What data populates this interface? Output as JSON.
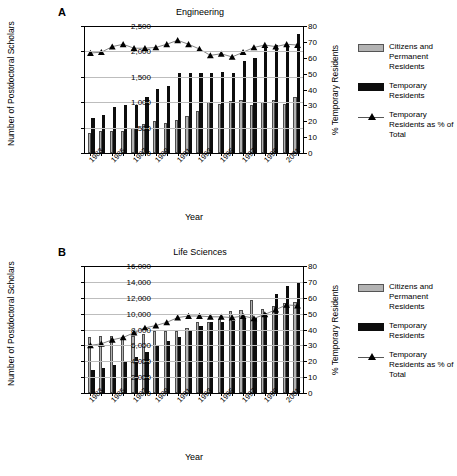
{
  "figure": {
    "panels": [
      {
        "letter": "A",
        "title": "Engineering",
        "xlabel": "Year",
        "ylabel_left": "Number of Postdoctoral Scholars",
        "ylabel_right": "% Temporary Residents"
      },
      {
        "letter": "B",
        "title": "Life Sciences",
        "xlabel": "Year",
        "ylabel_left": "Number of Postdoctoral Scholars",
        "ylabel_right": "% Temporary Residents"
      }
    ],
    "legend": {
      "items": [
        {
          "name": "citizens-swatch",
          "label": "Citizens and Permanent Residents",
          "color": "#b3b3b3"
        },
        {
          "name": "temporary-swatch",
          "label": "Temporary Residents",
          "color": "#0d0d0d"
        },
        {
          "name": "percent-line-marker",
          "label": "Temporary Residents as % of Total",
          "color": "#000000"
        }
      ]
    }
  },
  "chart_data": [
    {
      "type": "bar",
      "title": "Engineering",
      "panel": "A",
      "xlabel": "Year",
      "ylabel": "Number of Postdoctoral Scholars",
      "ylabel_secondary": "% Temporary Residents",
      "ylim": [
        0,
        2500
      ],
      "yticks": [
        "0",
        "500",
        "1,000",
        "1,500",
        "2,000",
        "2,500"
      ],
      "ylim_secondary": [
        0,
        80
      ],
      "yticks_secondary": [
        "0",
        "10",
        "20",
        "30",
        "40",
        "50",
        "60",
        "70",
        "80"
      ],
      "grid": true,
      "legend_position": "right",
      "categories": [
        1983,
        1984,
        1985,
        1986,
        1987,
        1988,
        1989,
        1990,
        1991,
        1992,
        1993,
        1994,
        1995,
        1996,
        1997,
        1998,
        1999,
        2000,
        2001,
        2002
      ],
      "xtick_labels": [
        "1983",
        "1985",
        "1987",
        "1989",
        "1991",
        "1993",
        "1995",
        "1997",
        "1999",
        "2001"
      ],
      "series": [
        {
          "name": "Citizens and Permanent Residents",
          "axis": "left",
          "color": "#b3b3b3",
          "values": [
            400,
            440,
            440,
            440,
            490,
            570,
            640,
            600,
            645,
            730,
            830,
            995,
            965,
            1015,
            1050,
            950,
            1000,
            1040,
            965,
            1095
          ]
        },
        {
          "name": "Temporary Residents",
          "axis": "left",
          "color": "#0d0d0d",
          "values": [
            680,
            755,
            905,
            945,
            945,
            1100,
            1255,
            1310,
            1570,
            1570,
            1570,
            1570,
            1600,
            1575,
            1805,
            1870,
            2105,
            2120,
            2110,
            2345
          ]
        },
        {
          "name": "Temporary Residents as % of Total",
          "axis": "right",
          "color": "#000000",
          "type": "line",
          "values": [
            63,
            63.5,
            67,
            68.5,
            66,
            66,
            66.5,
            68.5,
            71,
            68.5,
            65.5,
            61.5,
            62.5,
            60.5,
            63.5,
            66.5,
            68,
            67,
            68.5,
            68
          ]
        }
      ]
    },
    {
      "type": "bar",
      "title": "Life Sciences",
      "panel": "B",
      "xlabel": "Year",
      "ylabel": "Number of Postdoctoral Scholars",
      "ylabel_secondary": "% Temporary Residents",
      "ylim": [
        0,
        16000
      ],
      "yticks": [
        "0",
        "2,000",
        "4,000",
        "6,000",
        "8,000",
        "10,000",
        "12,000",
        "14,000",
        "16,000"
      ],
      "ylim_secondary": [
        0,
        80
      ],
      "yticks_secondary": [
        "0",
        "10",
        "20",
        "30",
        "40",
        "50",
        "60",
        "70",
        "80"
      ],
      "grid": true,
      "legend_position": "right",
      "categories": [
        1983,
        1984,
        1985,
        1986,
        1987,
        1988,
        1989,
        1990,
        1991,
        1992,
        1993,
        1994,
        1995,
        1996,
        1997,
        1998,
        1999,
        2000,
        2001,
        2002
      ],
      "xtick_labels": [
        "1983",
        "1985",
        "1987",
        "1989",
        "1991",
        "1993",
        "1995",
        "1997",
        "1999",
        "2001"
      ],
      "series": [
        {
          "name": "Citizens and Permanent Residents",
          "axis": "left",
          "color": "#b3b3b3",
          "values": [
            7100,
            7200,
            7150,
            7050,
            7200,
            7400,
            7800,
            7800,
            7800,
            8250,
            8950,
            8900,
            9350,
            10300,
            10500,
            11700,
            10600,
            11000,
            11400,
            11500
          ]
        },
        {
          "name": "Temporary Residents",
          "axis": "left",
          "color": "#0d0d0d",
          "values": [
            2900,
            3200,
            3550,
            4050,
            4500,
            5150,
            5900,
            6500,
            7050,
            7800,
            8400,
            8900,
            9000,
            9050,
            9450,
            9450,
            10100,
            12500,
            13500,
            14000
          ]
        },
        {
          "name": "Temporary Residents as % of Total",
          "axis": "right",
          "color": "#000000",
          "type": "line",
          "values": [
            30,
            31,
            33.5,
            35,
            38,
            41,
            42.5,
            44.5,
            47.5,
            48.5,
            48.5,
            48,
            48,
            47.5,
            48.5,
            47,
            49.5,
            52.5,
            55.5,
            55
          ]
        }
      ]
    }
  ]
}
